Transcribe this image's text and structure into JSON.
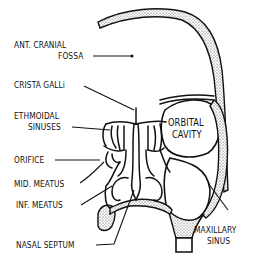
{
  "figure": {
    "type": "anatomical-diagram",
    "labels": {
      "ant_cranial_fossa_line1": "ANT. CRANIAL",
      "ant_cranial_fossa_line2": "FOSSA",
      "crista_galli": "CRISTA GALLi",
      "ethmoidal_sinuses_line1": "ETHMOIDAL",
      "ethmoidal_sinuses_line2": "SINUSES",
      "orifice": "ORIFICE",
      "mid_meatus": "MID. MEATUS",
      "inf_meatus": "INF. MEATUS",
      "nasal_septum": "NASAL SEPTUM",
      "orbital_cavity_line1": "ORBITAL",
      "orbital_cavity_line2": "CAVITY",
      "maxillary_sinus_line1": "MAXILLARY",
      "maxillary_sinus_line2": "SINUS"
    },
    "colors": {
      "ink": "#111111",
      "background": "#ffffff"
    }
  }
}
